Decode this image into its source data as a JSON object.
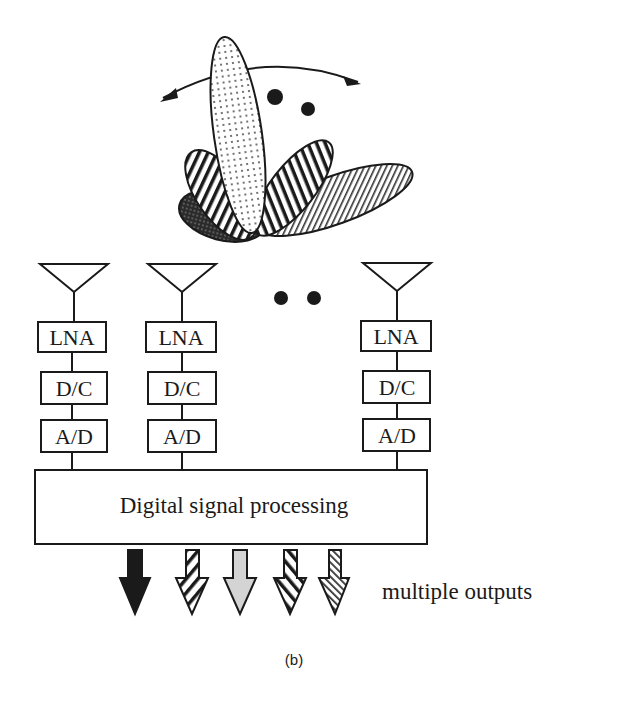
{
  "figure": {
    "caption": "(b)",
    "beam_pattern": {
      "description": "multiple steerable beams",
      "beams": [
        {
          "name": "beam-dotted",
          "pattern": "dots"
        },
        {
          "name": "beam-horizontal-stripes-left",
          "pattern": "horizontal-stripes"
        },
        {
          "name": "beam-crosshatch",
          "pattern": "dense-crosshatch"
        },
        {
          "name": "beam-horizontal-stripes-right",
          "pattern": "horizontal-stripes"
        },
        {
          "name": "beam-diagonal-hatch",
          "pattern": "diagonal-hatch"
        }
      ],
      "ellipsis": "• •"
    },
    "chains": [
      {
        "lna": "LNA",
        "dc": "D/C",
        "ad": "A/D"
      },
      {
        "lna": "LNA",
        "dc": "D/C",
        "ad": "A/D"
      },
      {
        "lna": "LNA",
        "dc": "D/C",
        "ad": "A/D"
      }
    ],
    "chain_ellipsis": "• •",
    "dsp_label": "Digital signal processing",
    "outputs_label": "multiple outputs",
    "outputs": [
      {
        "pattern": "solid"
      },
      {
        "pattern": "diagonal-stripes"
      },
      {
        "pattern": "light-gray"
      },
      {
        "pattern": "back-diagonal-stripes"
      },
      {
        "pattern": "fine-hatch"
      }
    ]
  }
}
